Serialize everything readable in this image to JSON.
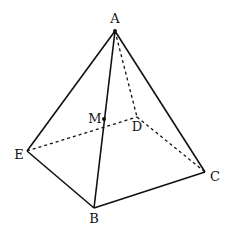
{
  "figure": {
    "type": "pyramid",
    "vertices": {
      "A": {
        "label": "A",
        "x": 115,
        "y": 31,
        "lx": 115,
        "ly": 23
      },
      "B": {
        "label": "B",
        "x": 94,
        "y": 208,
        "lx": 94,
        "ly": 223
      },
      "C": {
        "label": "C",
        "x": 205,
        "y": 172,
        "lx": 215,
        "ly": 181
      },
      "D": {
        "label": "D",
        "x": 137,
        "y": 117,
        "lx": 137,
        "ly": 131
      },
      "E": {
        "label": "E",
        "x": 27,
        "y": 151,
        "lx": 19,
        "ly": 159
      },
      "M": {
        "label": "M",
        "x": 104,
        "y": 119,
        "lx": 95,
        "ly": 123
      }
    },
    "solid_edges": [
      [
        "A",
        "E"
      ],
      [
        "A",
        "B"
      ],
      [
        "A",
        "C"
      ],
      [
        "E",
        "B"
      ],
      [
        "B",
        "C"
      ]
    ],
    "dashed_edges": [
      [
        "A",
        "D"
      ],
      [
        "E",
        "D"
      ],
      [
        "D",
        "C"
      ]
    ],
    "points": [
      "A",
      "M"
    ],
    "stroke_color": "#111111"
  }
}
